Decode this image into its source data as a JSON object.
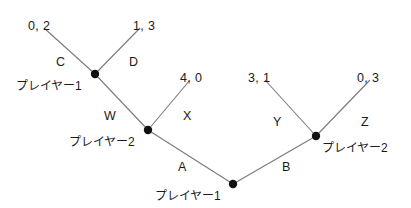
{
  "diagram": {
    "type": "extensive-form-game-tree",
    "title": "",
    "background_color": "#ffffff",
    "edge_color": "#7a7a7a",
    "node_color": "#111111",
    "text_color": "#1a1a1a"
  },
  "nodes": [
    {
      "id": "n-root",
      "label": "プレイヤー1",
      "player": "1",
      "x": 233,
      "y": 184,
      "label_x": 155,
      "label_y": 190,
      "label_align": "left"
    },
    {
      "id": "n-player2-l",
      "label": "プレイヤー2",
      "player": "2",
      "x": 148,
      "y": 130,
      "label_x": 69,
      "label_y": 136,
      "label_align": "left"
    },
    {
      "id": "n-player2-r",
      "label": "プレイヤー2",
      "player": "2",
      "x": 316,
      "y": 136,
      "label_x": 322,
      "label_y": 142,
      "label_align": "left"
    },
    {
      "id": "n-player1-t",
      "label": "プレイヤー1",
      "player": "1",
      "x": 95,
      "y": 74,
      "label_x": 16,
      "label_y": 80,
      "label_align": "left"
    }
  ],
  "edges": [
    {
      "id": "e-A",
      "action": "A",
      "from": "n-root",
      "to": "n-player2-l",
      "x1": 233,
      "y1": 184,
      "x2": 148,
      "y2": 130,
      "label_x": 178,
      "label_y": 161
    },
    {
      "id": "e-B",
      "action": "B",
      "from": "n-root",
      "to": "n-player2-r",
      "x1": 233,
      "y1": 184,
      "x2": 316,
      "y2": 136,
      "label_x": 282,
      "label_y": 161
    },
    {
      "id": "e-W",
      "action": "W",
      "from": "n-player2-l",
      "to": "n-player1-t",
      "x1": 148,
      "y1": 130,
      "x2": 95,
      "y2": 74,
      "label_x": 104,
      "label_y": 110
    },
    {
      "id": "e-X",
      "action": "X",
      "from": "n-player2-l",
      "to": "t-40",
      "x1": 148,
      "y1": 130,
      "x2": 190,
      "y2": 80,
      "label_x": 183,
      "label_y": 110
    },
    {
      "id": "e-C",
      "action": "C",
      "from": "n-player1-t",
      "to": "t-02",
      "x1": 95,
      "y1": 74,
      "x2": 44,
      "y2": 28,
      "label_x": 56,
      "label_y": 56
    },
    {
      "id": "e-D",
      "action": "D",
      "from": "n-player1-t",
      "to": "t-13",
      "x1": 95,
      "y1": 74,
      "x2": 140,
      "y2": 28,
      "label_x": 129,
      "label_y": 56
    },
    {
      "id": "e-Y",
      "action": "Y",
      "from": "n-player2-r",
      "to": "t-31",
      "x1": 316,
      "y1": 136,
      "x2": 265,
      "y2": 80,
      "label_x": 273,
      "label_y": 116
    },
    {
      "id": "e-Z",
      "action": "Z",
      "from": "n-player2-r",
      "to": "t-03",
      "x1": 316,
      "y1": 136,
      "x2": 370,
      "y2": 80,
      "label_x": 361,
      "label_y": 116
    }
  ],
  "terminals": [
    {
      "id": "t-02",
      "payoff": "0, 2",
      "x": 28,
      "y": 20
    },
    {
      "id": "t-13",
      "payoff": "1, 3",
      "x": 133,
      "y": 20
    },
    {
      "id": "t-40",
      "payoff": "4, 0",
      "x": 180,
      "y": 72
    },
    {
      "id": "t-31",
      "payoff": "3, 1",
      "x": 248,
      "y": 72
    },
    {
      "id": "t-03",
      "payoff": "0, 3",
      "x": 357,
      "y": 72
    }
  ]
}
